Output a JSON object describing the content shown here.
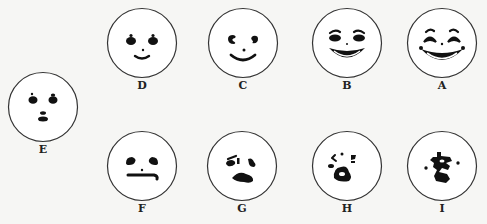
{
  "figure": {
    "faces": [
      {
        "id": "A",
        "label": "A",
        "expression": "very happy - wide laughing mouth, squinting eyes, raised brows",
        "cx": 442,
        "cy": 43
      },
      {
        "id": "B",
        "label": "B",
        "expression": "happy - broad smile, oval eyes, brows",
        "cx": 347,
        "cy": 43
      },
      {
        "id": "C",
        "label": "C",
        "expression": "mildly happy - smile, curled eyes",
        "cx": 243,
        "cy": 43
      },
      {
        "id": "D",
        "label": "D",
        "expression": "slightly happy - small smile",
        "cx": 142,
        "cy": 43
      },
      {
        "id": "E",
        "label": "E",
        "expression": "neutral - small mouth",
        "cx": 43,
        "cy": 107
      },
      {
        "id": "F",
        "label": "F",
        "expression": "slightly sad - flat mouth",
        "cx": 142,
        "cy": 166
      },
      {
        "id": "G",
        "label": "G",
        "expression": "sad - frowning mouth",
        "cx": 242,
        "cy": 166
      },
      {
        "id": "H",
        "label": "H",
        "expression": "very sad - distorted features",
        "cx": 347,
        "cy": 166
      },
      {
        "id": "I",
        "label": "I",
        "expression": "extremely distressed - scrambled features",
        "cx": 442,
        "cy": 166
      }
    ]
  },
  "colors": {
    "ink": "#111111",
    "outline": "#333333",
    "paper": "#f6f6f4"
  }
}
